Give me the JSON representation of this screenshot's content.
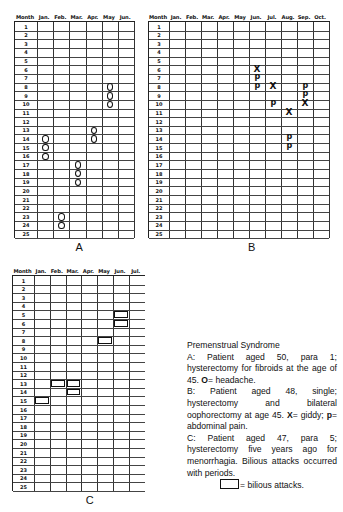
{
  "caption": {
    "title": "Premenstrual Syndrome",
    "a_text_1": "A: Patient aged 50, para 1; hysterectomy for fibroids at the age of 45.",
    "a_symbol": "O",
    "a_symbol_meaning": "= headache.",
    "b_text_1": "B: Patient aged 48, single; hysterectomy and bilateral oophorectomy at age 45.",
    "b_symbol_x": "X",
    "b_symbol_x_meaning": "= giddy;",
    "b_symbol_p": "p",
    "b_symbol_p_meaning": "= abdominal pain.",
    "c_text_1": "C: Patient aged 47, para 5; hysterectomy five years ago for menorrhagia. Bilious attacks occurred with periods.",
    "c_symbol_meaning": "= bilious attacks."
  },
  "chart_data": [
    {
      "type": "table",
      "panel": "A",
      "title": "A",
      "row_header": "Month",
      "columns": [
        "Jan.",
        "Feb.",
        "Mar.",
        "Apr.",
        "May",
        "Jun."
      ],
      "rows": [
        1,
        2,
        3,
        4,
        5,
        6,
        7,
        8,
        9,
        10,
        11,
        12,
        13,
        14,
        15,
        16,
        17,
        18,
        19,
        20,
        21,
        22,
        23,
        24,
        25
      ],
      "legend": {
        "O": "headache"
      },
      "markers": [
        {
          "month": "Jan.",
          "days": [
            14,
            15,
            16
          ],
          "symbol": "O"
        },
        {
          "month": "Feb.",
          "days": [
            23,
            24
          ],
          "symbol": "O"
        },
        {
          "month": "Mar.",
          "days": [
            17,
            18,
            19
          ],
          "symbol": "O"
        },
        {
          "month": "Apr.",
          "days": [
            13,
            14
          ],
          "symbol": "O"
        },
        {
          "month": "May",
          "days": [
            8,
            9,
            10
          ],
          "symbol": "O"
        }
      ]
    },
    {
      "type": "table",
      "panel": "B",
      "title": "B",
      "row_header": "Month",
      "columns": [
        "Jan.",
        "Feb.",
        "Mar.",
        "Apr.",
        "May",
        "Jun.",
        "Jul.",
        "Aug.",
        "Sep.",
        "Oct."
      ],
      "rows": [
        1,
        2,
        3,
        4,
        5,
        6,
        7,
        8,
        9,
        10,
        11,
        12,
        13,
        14,
        15,
        16,
        17,
        18,
        19,
        20,
        21,
        22,
        23,
        24,
        25
      ],
      "legend": {
        "X": "giddy",
        "p": "abdominal pain"
      },
      "markers": [
        {
          "month": "Jun.",
          "day": 6,
          "symbol": "X"
        },
        {
          "month": "Jun.",
          "day": 7,
          "symbol": "p"
        },
        {
          "month": "Jun.",
          "day": 8,
          "symbol": "p"
        },
        {
          "month": "Jul.",
          "day": 8,
          "symbol": "X"
        },
        {
          "month": "Jul.",
          "day": 10,
          "symbol": "p"
        },
        {
          "month": "Aug.",
          "day": 11,
          "symbol": "X"
        },
        {
          "month": "Aug.",
          "day": 14,
          "symbol": "p"
        },
        {
          "month": "Aug.",
          "day": 15,
          "symbol": "p"
        },
        {
          "month": "Sep.",
          "day": 8,
          "symbol": "p"
        },
        {
          "month": "Sep.",
          "day": 9,
          "symbol": "p"
        },
        {
          "month": "Sep.",
          "day": 10,
          "symbol": "X"
        }
      ]
    },
    {
      "type": "table",
      "panel": "C",
      "title": "C",
      "row_header": "Month",
      "columns": [
        "Jan.",
        "Feb.",
        "Mar.",
        "Apr.",
        "May",
        "Jun.",
        "Jul."
      ],
      "rows": [
        1,
        2,
        3,
        4,
        5,
        6,
        7,
        8,
        9,
        10,
        11,
        12,
        13,
        14,
        15,
        16,
        17,
        18,
        19,
        20,
        21,
        22,
        23,
        24,
        25
      ],
      "legend": {
        "box": "bilious attacks"
      },
      "markers": [
        {
          "month": "Jan.",
          "days": [
            15
          ],
          "symbol": "box"
        },
        {
          "month": "Feb.",
          "days": [
            13
          ],
          "symbol": "box"
        },
        {
          "month": "Mar.",
          "days": [
            13,
            14
          ],
          "symbol": "box"
        },
        {
          "month": "May",
          "days": [
            8
          ],
          "symbol": "box"
        },
        {
          "month": "Jun.",
          "days": [
            5,
            6
          ],
          "symbol": "box"
        }
      ]
    }
  ]
}
